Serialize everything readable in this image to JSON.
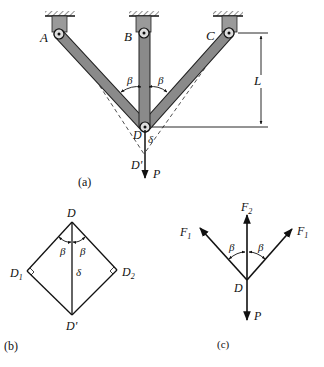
{
  "figure_a": {
    "caption": "(a)",
    "supports": [
      "A",
      "B",
      "C"
    ],
    "joint": "D",
    "displaced_joint": "D'",
    "angle_left": "β",
    "angle_right": "β",
    "length_label": "L",
    "deflection_label": "δ",
    "load_label": "P"
  },
  "figure_b": {
    "caption": "(b)",
    "top": "D",
    "left": "D",
    "left_sub": "1",
    "right": "D",
    "right_sub": "2",
    "bottom": "D'",
    "angle_left": "β",
    "angle_right": "β",
    "deflection_label": "δ"
  },
  "figure_c": {
    "caption": "(c)",
    "force_left": "F",
    "force_left_sub": "1",
    "force_center": "F",
    "force_center_sub": "2",
    "force_right": "F",
    "force_right_sub": "1",
    "angle_left": "β",
    "angle_right": "β",
    "joint": "D",
    "load_label": "P"
  }
}
